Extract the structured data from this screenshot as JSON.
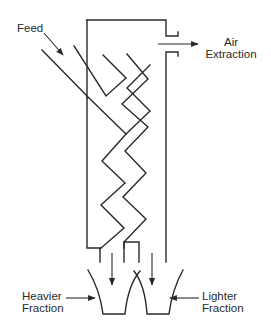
{
  "diagram": {
    "colors": {
      "line": "#2a2a2a",
      "background": "#ffffff",
      "text": "#2a2a2a"
    },
    "labels": {
      "feed": "Feed",
      "air_extraction": [
        "Air",
        "Extraction"
      ],
      "heavier_fraction": [
        "Heavier",
        "Fraction"
      ],
      "lighter_fraction": [
        "Lighter",
        "Fraction"
      ]
    },
    "components": [
      {
        "id": "feed-inlet",
        "name": "Feed inlet chute"
      },
      {
        "id": "column-housing",
        "name": "Classifier column housing"
      },
      {
        "id": "zigzag-channel",
        "name": "Zigzag separation channel"
      },
      {
        "id": "air-outlet",
        "name": "Air extraction outlet"
      },
      {
        "id": "heavy-hopper",
        "name": "Heavier fraction hopper"
      },
      {
        "id": "light-hopper",
        "name": "Lighter fraction hopper"
      }
    ],
    "flows": [
      {
        "from": "feed",
        "to": "zigzag-channel",
        "label": "Feed"
      },
      {
        "from": "column-housing",
        "to": "air-outlet",
        "label": "Air Extraction"
      },
      {
        "from": "zigzag-channel",
        "to": "heavy-hopper",
        "label": "Heavier Fraction"
      },
      {
        "from": "column-housing",
        "to": "light-hopper",
        "label": "Lighter Fraction"
      }
    ]
  }
}
